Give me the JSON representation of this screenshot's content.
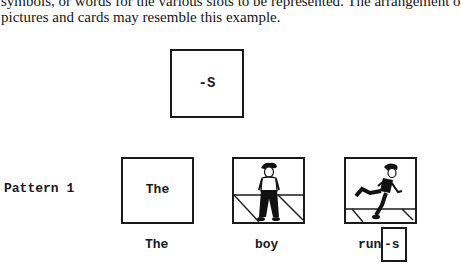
{
  "document": {
    "body_text": {
      "line1": "symbols, or words for the various slots to be represented. The arrangement o",
      "line2": "pictures and cards may resemble this example."
    },
    "suffix_card": {
      "text": "-S"
    },
    "pattern": {
      "label": "Pattern 1",
      "cards": [
        {
          "type": "text",
          "text": "The",
          "caption": "The"
        },
        {
          "type": "picture",
          "picture": "boy-standing",
          "caption": "boy"
        },
        {
          "type": "picture",
          "picture": "boy-running",
          "caption_stem": "run",
          "caption_suffix": "-s"
        }
      ]
    }
  }
}
